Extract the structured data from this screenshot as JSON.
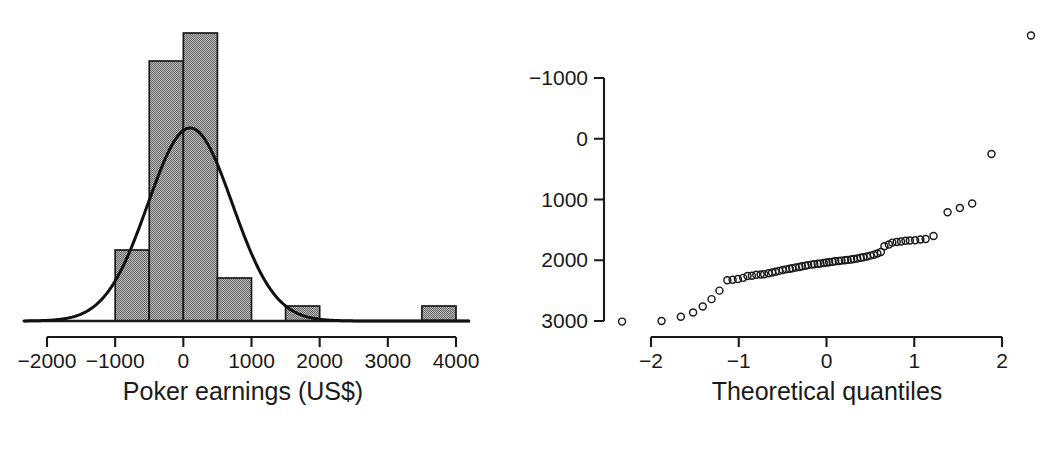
{
  "figure": {
    "background": "#ffffff",
    "ink_color": "#1a1a1a",
    "bar_fill": "#8c8c8c",
    "panels": 2
  },
  "chart_data": [
    {
      "type": "bar",
      "name": "poker-earnings-histogram",
      "title": "",
      "xlabel": "Poker earnings (US$)",
      "ylabel": "",
      "grid": false,
      "legend": "none",
      "overlay": "normal density curve",
      "xlim": [
        -2000,
        4000
      ],
      "xticks": [
        -2000,
        -1000,
        0,
        1000,
        2000,
        3000,
        4000
      ],
      "xtick_labels": [
        "−2000",
        "−1000",
        "0",
        "1000",
        "2000",
        "3000",
        "4000"
      ],
      "bin_width": 500,
      "categories": [
        "-1000 to -500",
        "-500 to 0",
        "0 to 500",
        "500 to 1000",
        "1500 to 2000",
        "3500 to 4000"
      ],
      "bin_edges": [
        [
          -1000,
          -500
        ],
        [
          -500,
          0
        ],
        [
          0,
          500
        ],
        [
          500,
          1000
        ],
        [
          1500,
          2000
        ],
        [
          3500,
          4000
        ]
      ],
      "values": [
        5,
        21,
        23,
        3,
        1,
        1
      ],
      "bar_tops_px": [
        250,
        61,
        33,
        278,
        306,
        306
      ],
      "baseline_px": 321,
      "density_overlay": {
        "mean": 100,
        "sd": 620,
        "peak_px": {
          "x": 190,
          "y": 128
        }
      }
    },
    {
      "type": "scatter",
      "name": "normal-qq-plot",
      "title": "",
      "xlabel": "Theoretical quantiles",
      "ylabel": "",
      "grid": false,
      "legend": "none",
      "xlim": [
        -2.45,
        2.45
      ],
      "ylim": [
        -1100,
        3750
      ],
      "xticks": [
        -2,
        -1,
        0,
        1,
        2
      ],
      "xtick_labels": [
        "−2",
        "−1",
        "0",
        "1",
        "2"
      ],
      "yticks": [
        -1000,
        0,
        1000,
        2000,
        3000
      ],
      "ytick_labels": [
        "−1000",
        "0",
        "1000",
        "2000",
        "3000"
      ],
      "marker": "open-circle",
      "points": [
        [
          -2.33,
          -1010
        ],
        [
          -1.88,
          -1000
        ],
        [
          -1.66,
          -930
        ],
        [
          -1.52,
          -860
        ],
        [
          -1.41,
          -760
        ],
        [
          -1.31,
          -640
        ],
        [
          -1.22,
          -500
        ],
        [
          -1.13,
          -330
        ],
        [
          -1.07,
          -320
        ],
        [
          -1.01,
          -310
        ],
        [
          -0.95,
          -290
        ],
        [
          -0.9,
          -260
        ],
        [
          -0.85,
          -255
        ],
        [
          -0.8,
          -240
        ],
        [
          -0.75,
          -235
        ],
        [
          -0.71,
          -230
        ],
        [
          -0.66,
          -215
        ],
        [
          -0.62,
          -200
        ],
        [
          -0.58,
          -190
        ],
        [
          -0.54,
          -175
        ],
        [
          -0.5,
          -160
        ],
        [
          -0.46,
          -150
        ],
        [
          -0.42,
          -140
        ],
        [
          -0.39,
          -130
        ],
        [
          -0.35,
          -120
        ],
        [
          -0.31,
          -110
        ],
        [
          -0.28,
          -100
        ],
        [
          -0.24,
          -90
        ],
        [
          -0.21,
          -80
        ],
        [
          -0.17,
          -72
        ],
        [
          -0.14,
          -65
        ],
        [
          -0.1,
          -58
        ],
        [
          -0.07,
          -52
        ],
        [
          -0.03,
          -45
        ],
        [
          0.0,
          -38
        ],
        [
          0.03,
          -32
        ],
        [
          0.07,
          -25
        ],
        [
          0.1,
          -18
        ],
        [
          0.14,
          -12
        ],
        [
          0.17,
          -6
        ],
        [
          0.21,
          0
        ],
        [
          0.24,
          6
        ],
        [
          0.28,
          14
        ],
        [
          0.31,
          22
        ],
        [
          0.35,
          30
        ],
        [
          0.39,
          40
        ],
        [
          0.42,
          50
        ],
        [
          0.46,
          62
        ],
        [
          0.5,
          76
        ],
        [
          0.54,
          92
        ],
        [
          0.58,
          110
        ],
        [
          0.62,
          135
        ],
        [
          0.66,
          230
        ],
        [
          0.71,
          260
        ],
        [
          0.75,
          290
        ],
        [
          0.8,
          300
        ],
        [
          0.85,
          310
        ],
        [
          0.9,
          320
        ],
        [
          0.95,
          325
        ],
        [
          1.01,
          330
        ],
        [
          1.07,
          340
        ],
        [
          1.13,
          350
        ],
        [
          1.22,
          400
        ],
        [
          1.38,
          790
        ],
        [
          1.52,
          860
        ],
        [
          1.66,
          935
        ],
        [
          1.88,
          1750
        ],
        [
          2.33,
          3700
        ]
      ],
      "n_points": 68,
      "notable": {
        "max_outlier": [
          2.33,
          3700
        ],
        "min_outlier": [
          -2.33,
          -1010
        ]
      }
    }
  ],
  "hist_panel": {
    "xlabel": "Poker earnings (US$)",
    "xtick_labels": [
      "−2000",
      "−1000",
      "0",
      "1000",
      "2000",
      "3000",
      "4000"
    ]
  },
  "qq_panel": {
    "xlabel": "Theoretical quantiles",
    "xtick_labels": [
      "−2",
      "−1",
      "0",
      "1",
      "2"
    ],
    "ytick_labels": [
      "3000",
      "2000",
      "1000",
      "0",
      "−1000"
    ]
  }
}
